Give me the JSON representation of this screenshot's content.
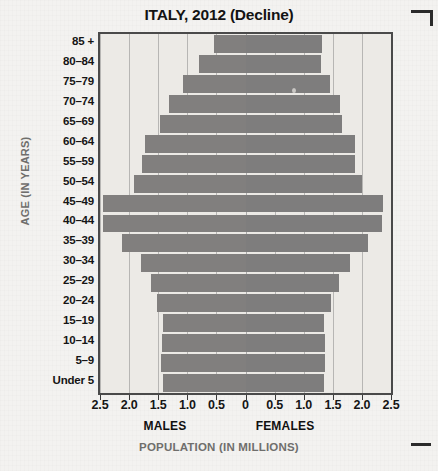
{
  "chart_data": {
    "type": "bar",
    "subtype": "population-pyramid",
    "title": "ITALY, 2012 (Decline)",
    "xlabel": "POPULATION (IN MILLIONS)",
    "ylabel": "AGE (IN YEARS)",
    "categories": [
      "85 +",
      "80–84",
      "75–79",
      "70–74",
      "65–69",
      "60–64",
      "55–59",
      "50–54",
      "45–49",
      "40–44",
      "35–39",
      "30–34",
      "25–29",
      "20–24",
      "15–19",
      "10–14",
      "5–9",
      "Under 5"
    ],
    "series": [
      {
        "name": "MALES",
        "side": "left",
        "values": [
          0.55,
          0.8,
          1.07,
          1.32,
          1.47,
          1.73,
          1.78,
          1.92,
          2.45,
          2.45,
          2.12,
          1.8,
          1.63,
          1.52,
          1.42,
          1.43,
          1.45,
          1.42
        ]
      },
      {
        "name": "FEMALES",
        "side": "right",
        "values": [
          1.32,
          1.3,
          1.45,
          1.62,
          1.65,
          1.88,
          1.88,
          2.0,
          2.37,
          2.35,
          2.1,
          1.8,
          1.6,
          1.47,
          1.35,
          1.37,
          1.37,
          1.35
        ]
      }
    ],
    "xticks": [
      "2.5",
      "2.0",
      "1.5",
      "1.0",
      "0.5",
      "0",
      "0.5",
      "1.0",
      "1.5",
      "2.0",
      "2.5"
    ],
    "xtick_values": [
      -2.5,
      -2.0,
      -1.5,
      -1.0,
      -0.5,
      0,
      0.5,
      1.0,
      1.5,
      2.0,
      2.5
    ],
    "xlim": [
      -2.5,
      2.5
    ],
    "grid": true,
    "legend": "none",
    "bar_color": "#807f7f",
    "plot_bg": "#eceae6",
    "frame_color": "#4a4a4a",
    "axis_title_color": "#6f6e6c"
  },
  "axis": {
    "males_label": "MALES",
    "females_label": "FEMALES"
  }
}
